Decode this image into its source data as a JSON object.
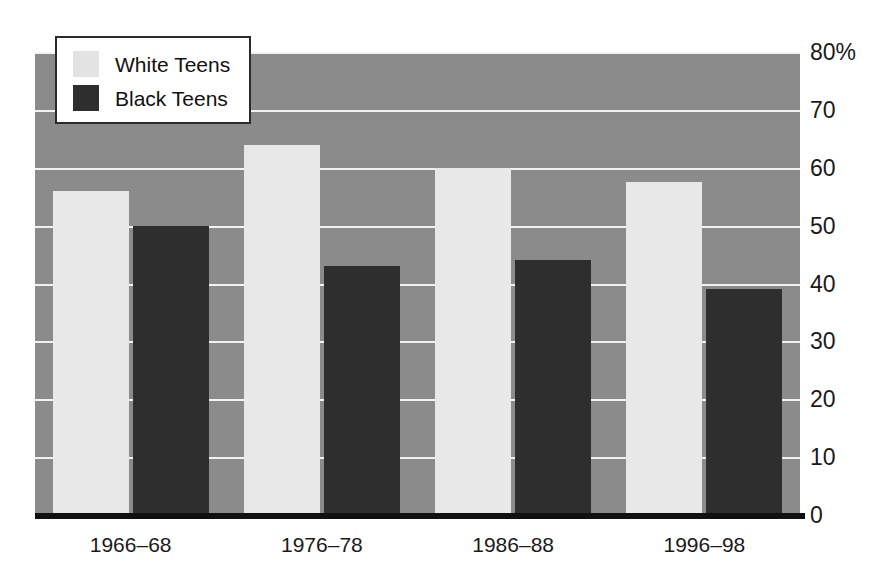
{
  "chart_data": {
    "type": "bar",
    "title": "",
    "xlabel": "",
    "ylabel": "",
    "ylim": [
      0,
      80
    ],
    "grid": true,
    "legend_position": "top-left",
    "categories": [
      "1966–68",
      "1976–78",
      "1986–88",
      "1996–98"
    ],
    "yticks": [
      "0",
      "10",
      "20",
      "30",
      "40",
      "50",
      "60",
      "70",
      "80%"
    ],
    "ytick_values": [
      0,
      10,
      20,
      30,
      40,
      50,
      60,
      70,
      80
    ],
    "series": [
      {
        "name": "White Teens",
        "color": "#e8e8e8",
        "values": [
          56,
          64,
          60,
          57.5
        ]
      },
      {
        "name": "Black Teens",
        "color": "#2e2e2e",
        "values": [
          50,
          43,
          44,
          39
        ]
      }
    ]
  },
  "legend": {
    "items": [
      {
        "label": "White Teens",
        "swatch": "white"
      },
      {
        "label": "Black Teens",
        "swatch": "black"
      }
    ]
  },
  "colors": {
    "plot_background": "#8b8b8b",
    "gridline": "#f2f2f2",
    "axis": "#111111",
    "white_bar": "#e8e8e8",
    "black_bar": "#2e2e2e"
  }
}
